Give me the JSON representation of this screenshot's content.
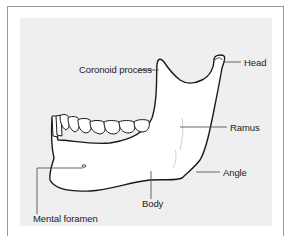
{
  "diagram": {
    "colors": {
      "frame_border": "#9a9a9a",
      "panel_background": "#efefef",
      "bone_fill": "#ffffff",
      "outline": "#1a1a1a",
      "leader_line": "#555555"
    },
    "labels": [
      {
        "id": "coronoid",
        "text": "Coronoid process"
      },
      {
        "id": "head",
        "text": "Head"
      },
      {
        "id": "ramus",
        "text": "Ramus"
      },
      {
        "id": "angle",
        "text": "Angle"
      },
      {
        "id": "body",
        "text": "Body"
      },
      {
        "id": "mental",
        "text": "Mental foramen"
      }
    ]
  }
}
